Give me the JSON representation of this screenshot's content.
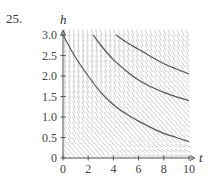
{
  "problem_number": "25.",
  "chart_data": {
    "type": "line",
    "title": "",
    "xlabel": "t",
    "ylabel": "h",
    "xlim": [
      0,
      10
    ],
    "ylim": [
      0,
      3.0
    ],
    "x_ticks": [
      "0",
      "2",
      "4",
      "6",
      "8",
      "10"
    ],
    "y_ticks": [
      "0",
      "0.5",
      "1.0",
      "1.5",
      "2.0",
      "2.5",
      "3.0"
    ],
    "grid": false,
    "direction_field": true,
    "series": [
      {
        "name": "solution-1",
        "points": [
          [
            0,
            3.0
          ],
          [
            1,
            2.45
          ],
          [
            2,
            2.0
          ],
          [
            3,
            1.6
          ],
          [
            4,
            1.3
          ],
          [
            5,
            1.08
          ],
          [
            6,
            0.9
          ],
          [
            7,
            0.74
          ],
          [
            8,
            0.6
          ],
          [
            9,
            0.5
          ],
          [
            10,
            0.4
          ]
        ]
      },
      {
        "name": "solution-2",
        "points": [
          [
            2.4,
            3.0
          ],
          [
            3,
            2.75
          ],
          [
            4,
            2.4
          ],
          [
            5,
            2.13
          ],
          [
            6,
            1.9
          ],
          [
            7,
            1.73
          ],
          [
            8,
            1.6
          ],
          [
            9,
            1.49
          ],
          [
            10,
            1.4
          ]
        ]
      },
      {
        "name": "solution-3",
        "points": [
          [
            4.2,
            3.0
          ],
          [
            5,
            2.83
          ],
          [
            6,
            2.65
          ],
          [
            7,
            2.47
          ],
          [
            8,
            2.3
          ],
          [
            9,
            2.17
          ],
          [
            10,
            2.05
          ]
        ]
      }
    ]
  }
}
